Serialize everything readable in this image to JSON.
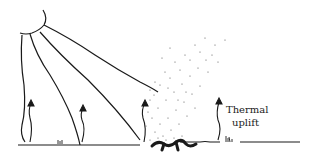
{
  "diagram": {
    "labels": {
      "thermal_line1": "Thermal",
      "thermal_line2": "uplift"
    },
    "colors": {
      "ink": "#1a1a1a",
      "dots": "#555555",
      "background": "#ffffff"
    }
  }
}
